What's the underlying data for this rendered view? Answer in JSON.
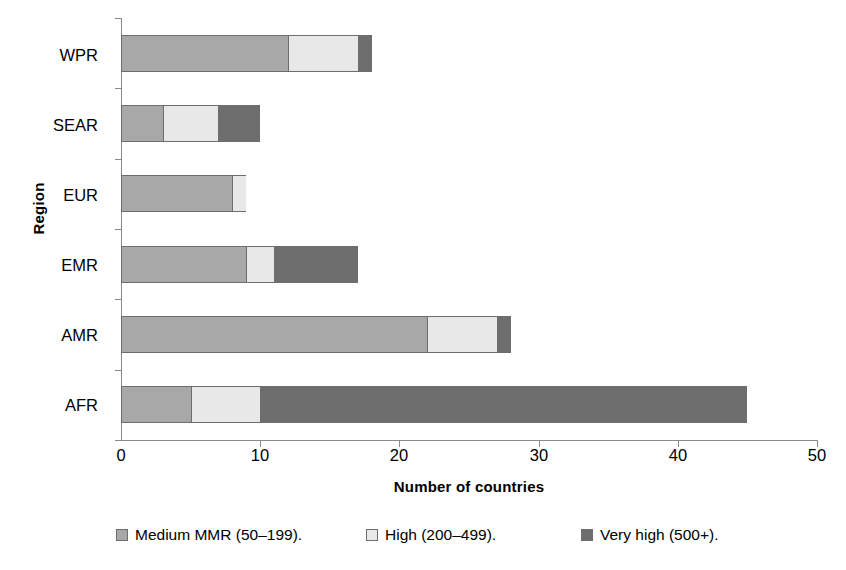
{
  "chart_data": {
    "type": "bar",
    "orientation": "horizontal",
    "stacked": true,
    "title": "",
    "xlabel": "Number of countries",
    "ylabel": "Region",
    "xlim": [
      0,
      50
    ],
    "xticks": [
      0,
      10,
      20,
      30,
      40,
      50
    ],
    "xtick_labels": [
      "0",
      "10",
      "20",
      "30",
      "40",
      "50"
    ],
    "grid": false,
    "legend_position": "bottom",
    "categories": [
      "AFR",
      "AMR",
      "EMR",
      "EUR",
      "SEAR",
      "WPR"
    ],
    "categories_top_to_bottom": [
      "WPR",
      "SEAR",
      "EUR",
      "EMR",
      "AMR",
      "AFR"
    ],
    "series": [
      {
        "name": "Medium MMR (50–199).",
        "color": "#a8a8a8",
        "values": [
          5,
          22,
          9,
          8,
          3,
          12
        ]
      },
      {
        "name": "High (200–499).",
        "color": "#e8e8e8",
        "values": [
          5,
          5,
          2,
          1,
          4,
          5
        ]
      },
      {
        "name": "Very high (500+).",
        "color": "#6e6e6e",
        "values": [
          35,
          1,
          6,
          0,
          3,
          1
        ]
      }
    ],
    "totals": [
      45,
      28,
      17,
      9,
      10,
      18
    ]
  },
  "legend": {
    "items": [
      {
        "label": "Medium MMR (50–199).",
        "color": "#a8a8a8"
      },
      {
        "label": "High (200–499).",
        "color": "#e8e8e8"
      },
      {
        "label": "Very high (500+).",
        "color": "#6e6e6e"
      }
    ]
  },
  "axes": {
    "x_title": "Number of countries",
    "y_title": "Region",
    "x_tick_labels": [
      "0",
      "10",
      "20",
      "30",
      "40",
      "50"
    ],
    "y_tick_labels": [
      "WPR",
      "SEAR",
      "EUR",
      "EMR",
      "AMR",
      "AFR"
    ]
  }
}
